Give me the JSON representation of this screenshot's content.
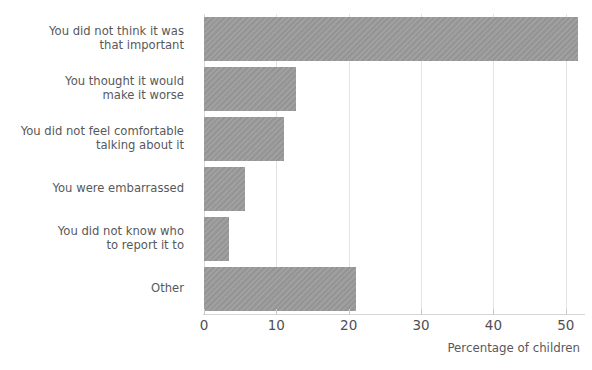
{
  "chart_data": {
    "type": "bar",
    "orientation": "horizontal",
    "title": "",
    "xlabel": "Percentage of children",
    "ylabel": "",
    "categories": [
      "You did not think it was\nthat important",
      "You thought it would\nmake it worse",
      "You did not feel comfortable\ntalking about it",
      "You were embarrassed",
      "You did not know who\nto report it to",
      "Other"
    ],
    "values": [
      51.7,
      12.7,
      11.0,
      5.7,
      3.5,
      21.0
    ],
    "xlim": [
      0,
      52
    ],
    "xticks": [
      0,
      10,
      20,
      30,
      40,
      50
    ],
    "xtick_labels": [
      "0",
      "10",
      "20",
      "30",
      "40",
      "50"
    ],
    "grid": "vertical",
    "legend": "none",
    "bar_color": "#9b9b9b",
    "gridline_color": "#e3e3e3",
    "text_color": "#58585a"
  },
  "header": {
    "truncated_title": ""
  }
}
